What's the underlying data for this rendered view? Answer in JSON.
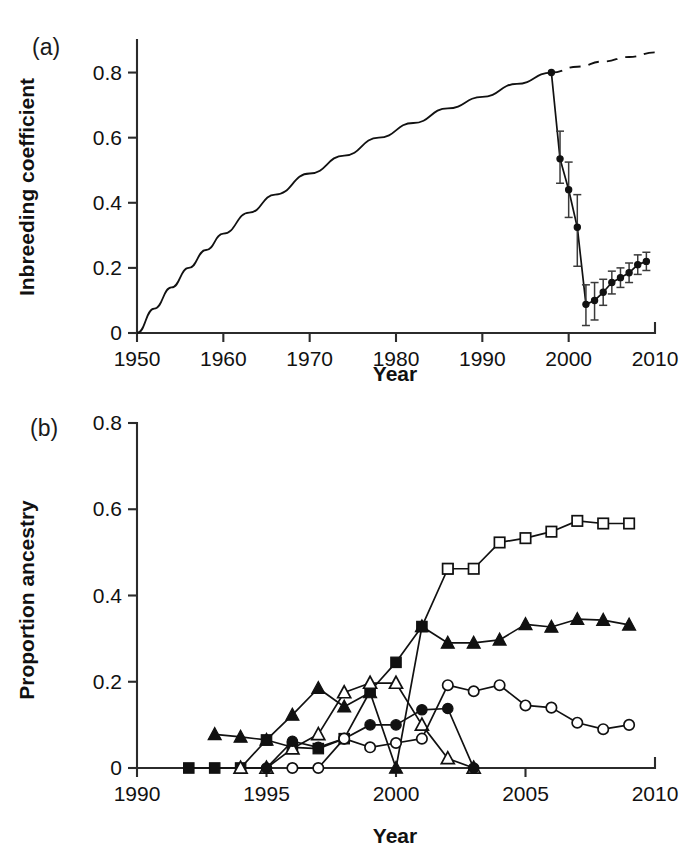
{
  "figure": {
    "panel_a_tag": "(a)",
    "panel_b_tag": "(b)"
  },
  "chart_data": [
    {
      "id": "panel_a",
      "type": "line",
      "title": "",
      "xlabel": "Year",
      "ylabel": "Inbreeding coefficient",
      "xlim": [
        1950,
        2010
      ],
      "ylim": [
        0,
        0.9
      ],
      "xticks": [
        1950,
        1960,
        1970,
        1980,
        1990,
        2000,
        2010
      ],
      "xtick_labels": [
        "1950",
        "1960",
        "1970",
        "1980",
        "1990",
        "2000",
        "2010"
      ],
      "yticks": [
        0,
        0.2,
        0.4,
        0.6,
        0.8
      ],
      "ytick_labels": [
        "0",
        "0.2",
        "0.4",
        "0.6",
        "0.8"
      ],
      "grid": false,
      "legend": "none",
      "series": [
        {
          "name": "Projected inbreeding accumulation (solid)",
          "style": "solid-curve",
          "x": [
            1950,
            1952,
            1954,
            1956,
            1958,
            1960,
            1963,
            1966,
            1970,
            1974,
            1978,
            1982,
            1986,
            1990,
            1994,
            1998
          ],
          "values": [
            0.0,
            0.075,
            0.14,
            0.2,
            0.255,
            0.305,
            0.37,
            0.425,
            0.49,
            0.545,
            0.6,
            0.645,
            0.69,
            0.725,
            0.765,
            0.8
          ]
        },
        {
          "name": "Projected inbreeding without immigration (dashed)",
          "style": "dashed-curve",
          "x": [
            1998,
            2001,
            2004,
            2007,
            2010
          ],
          "values": [
            0.8,
            0.818,
            0.834,
            0.848,
            0.862
          ]
        },
        {
          "name": "Observed inbreeding coefficient",
          "style": "filled-circle-errorbar",
          "x": [
            1998,
            1999,
            2000,
            2001,
            2002,
            2003,
            2004,
            2005,
            2006,
            2007,
            2008,
            2009
          ],
          "values": [
            0.8,
            0.535,
            0.44,
            0.325,
            0.088,
            0.1,
            0.125,
            0.155,
            0.17,
            0.185,
            0.21,
            0.22
          ],
          "err_low": [
            0.0,
            0.075,
            0.085,
            0.12,
            0.065,
            0.06,
            0.04,
            0.035,
            0.03,
            0.03,
            0.03,
            0.028
          ],
          "err_high": [
            0.0,
            0.085,
            0.085,
            0.1,
            0.06,
            0.055,
            0.04,
            0.035,
            0.03,
            0.03,
            0.03,
            0.028
          ]
        }
      ]
    },
    {
      "id": "panel_b",
      "type": "line",
      "title": "",
      "xlabel": "Year",
      "ylabel": "Proportion ancestry",
      "xlim": [
        1990,
        2010
      ],
      "ylim": [
        0,
        0.8
      ],
      "xticks": [
        1990,
        1995,
        2000,
        2005,
        2010
      ],
      "xtick_labels": [
        "1990",
        "1995",
        "2000",
        "2005",
        "2010"
      ],
      "yticks": [
        0,
        0.2,
        0.4,
        0.6,
        0.8
      ],
      "ytick_labels": [
        "0",
        "0.2",
        "0.4",
        "0.6",
        "0.8"
      ],
      "grid": false,
      "legend": "none",
      "series": [
        {
          "name": "Filled square",
          "marker": "filled-square",
          "x": [
            1992,
            1993,
            1994,
            1995,
            1996,
            1997,
            1998,
            1999,
            2000,
            2001,
            2002
          ],
          "values": [
            0.0,
            0.0,
            0.0,
            0.065,
            0.048,
            0.045,
            0.068,
            0.178,
            0.245,
            0.328,
            0.462
          ]
        },
        {
          "name": "Open square",
          "marker": "open-square",
          "x": [
            2002,
            2003,
            2004,
            2005,
            2006,
            2007,
            2008,
            2009
          ],
          "values": [
            0.462,
            0.462,
            0.523,
            0.533,
            0.548,
            0.573,
            0.567,
            0.567
          ]
        },
        {
          "name": "Filled triangle",
          "marker": "filled-triangle",
          "x": [
            1993,
            1994,
            1995,
            1996,
            1997,
            1998,
            1999,
            2000,
            2001,
            2002,
            2003,
            2004,
            2005,
            2006,
            2007,
            2008,
            2009
          ],
          "values": [
            0.078,
            0.072,
            0.065,
            0.123,
            0.185,
            0.142,
            0.175,
            0.0,
            0.328,
            0.29,
            0.29,
            0.297,
            0.333,
            0.327,
            0.345,
            0.343,
            0.332
          ]
        },
        {
          "name": "Open triangle",
          "marker": "open-triangle",
          "x": [
            1994,
            1995,
            1996,
            1997,
            1998,
            1999,
            2000,
            2001,
            2002,
            2003
          ],
          "values": [
            0.0,
            0.0,
            0.045,
            0.078,
            0.175,
            0.197,
            0.197,
            0.1,
            0.022,
            0.0
          ]
        },
        {
          "name": "Filled circle",
          "marker": "filled-circle",
          "x": [
            1995,
            1996,
            1997,
            1998,
            1999,
            2000,
            2001,
            2002,
            2003
          ],
          "values": [
            0.0,
            0.062,
            0.048,
            0.068,
            0.1,
            0.1,
            0.135,
            0.138,
            0.0
          ]
        },
        {
          "name": "Open circle",
          "marker": "open-circle",
          "x": [
            1996,
            1997,
            1998,
            1999,
            2000,
            2001,
            2002,
            2003,
            2004,
            2005,
            2006,
            2007,
            2008,
            2009
          ],
          "values": [
            0.0,
            0.0,
            0.068,
            0.048,
            0.058,
            0.068,
            0.192,
            0.178,
            0.192,
            0.145,
            0.14,
            0.105,
            0.09,
            0.1
          ]
        }
      ]
    }
  ]
}
